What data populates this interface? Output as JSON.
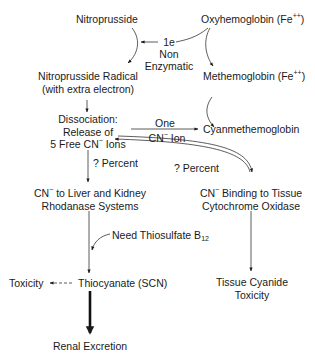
{
  "diagram": {
    "nodes": {
      "nitroprusside": "Nitroprusside",
      "oxyhemoglobin": "Oxyhemoglobin (Fe",
      "oxyhemoglobin_sup": "++",
      "oxyhemoglobin_close": ")",
      "nitroprusside_radical_l1": "Nitroprusside Radical",
      "nitroprusside_radical_l2": "(with extra electron)",
      "methemoglobin": "Methemoglobin (Fe",
      "methemoglobin_sup": "++",
      "methemoglobin_close": ")",
      "dissociation_l1": "Dissociation:",
      "dissociation_l2": "Release of",
      "dissociation_l3a": "5 Free CN",
      "dissociation_l3sup": "−",
      "dissociation_l3b": " Ions",
      "cyanmethemoglobin": "Cyanmethemoglobin",
      "liver_l1a": "CN",
      "liver_l1sup": "−",
      "liver_l1b": " to Liver and Kidney",
      "liver_l2": "Rhodanase Systems",
      "tissue_l1a": "CN",
      "tissue_l1sup": "−",
      "tissue_l1b": " Binding to Tissue",
      "tissue_l2": "Cytochrome Oxidase",
      "toxicity": "Toxicity",
      "thiocyanate": "Thiocyanate (SCN)",
      "tissue_toxicity_l1": "Tissue Cyanide",
      "tissue_toxicity_l2": "Toxicity",
      "renal": "Renal Excretion"
    },
    "edge_labels": {
      "one_e": "1e",
      "non": "Non",
      "enzymatic": "Enzymatic",
      "one": "One",
      "cn_ion_a": "CN",
      "cn_ion_sup": "−",
      "cn_ion_b": " Ion",
      "percent_left": "? Percent",
      "percent_right": "? Percent",
      "need_thiosulfate": "Need Thiosulfate B",
      "need_thiosulfate_sub": "12"
    }
  }
}
